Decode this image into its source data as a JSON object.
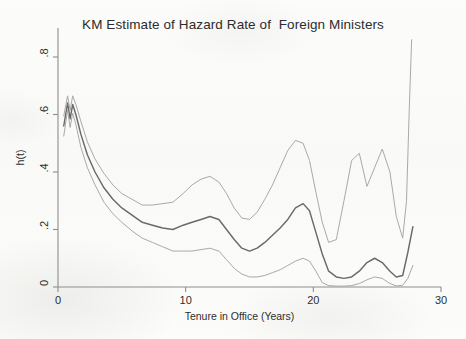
{
  "chart_data": {
    "type": "line",
    "title": "KM Estimate of Hazard Rate of  Foreign Ministers",
    "xlabel": "Tenure in Office (Years)",
    "ylabel": "h(t)",
    "xlim": [
      0,
      30
    ],
    "ylim": [
      0,
      0.9
    ],
    "xticks": [
      0,
      10,
      20,
      30
    ],
    "xticklabels": [
      "0",
      "10",
      "20",
      "30"
    ],
    "yticks": [
      0,
      0.2,
      0.4,
      0.6,
      0.8
    ],
    "yticklabels": [
      "0",
      ".2",
      ".4",
      ".6",
      ".8"
    ],
    "grid": false,
    "legend": "none",
    "colors": {
      "estimate": "#6a6a6a",
      "confidence_band": "#a9a9a9",
      "axis": "#8d8d8d",
      "text": "#2c2c2c",
      "background": "#fbfbfa"
    },
    "series": [
      {
        "name": "Smoothed hazard estimate",
        "role": "estimate",
        "color": "#6a6a6a",
        "x": [
          0.45,
          0.75,
          0.95,
          1.15,
          1.4,
          1.8,
          2.3,
          2.9,
          3.6,
          4.3,
          5.0,
          5.8,
          6.6,
          7.4,
          8.2,
          9.0,
          9.8,
          10.5,
          11.2,
          11.9,
          12.6,
          13.2,
          13.8,
          14.4,
          15.0,
          15.6,
          16.2,
          16.8,
          17.4,
          18.0,
          18.6,
          19.2,
          19.7,
          20.2,
          20.7,
          21.2,
          21.8,
          22.4,
          23.0,
          23.6,
          24.2,
          24.8,
          25.4,
          26.0,
          26.5,
          27.0,
          27.4,
          27.8
        ],
        "y": [
          0.56,
          0.64,
          0.585,
          0.635,
          0.6,
          0.53,
          0.46,
          0.4,
          0.345,
          0.305,
          0.275,
          0.25,
          0.225,
          0.215,
          0.205,
          0.2,
          0.215,
          0.225,
          0.235,
          0.245,
          0.235,
          0.2,
          0.165,
          0.135,
          0.125,
          0.135,
          0.155,
          0.18,
          0.205,
          0.235,
          0.275,
          0.29,
          0.265,
          0.19,
          0.115,
          0.055,
          0.035,
          0.03,
          0.035,
          0.055,
          0.085,
          0.1,
          0.085,
          0.055,
          0.035,
          0.04,
          0.12,
          0.21
        ]
      },
      {
        "name": "Upper 95% confidence limit",
        "role": "upper",
        "color": "#a9a9a9",
        "x": [
          0.45,
          0.75,
          0.95,
          1.15,
          1.4,
          1.8,
          2.3,
          2.9,
          3.6,
          4.3,
          5.0,
          5.8,
          6.6,
          7.4,
          8.2,
          9.0,
          9.8,
          10.5,
          11.2,
          11.9,
          12.6,
          13.2,
          13.8,
          14.4,
          15.0,
          15.6,
          16.2,
          16.8,
          17.4,
          18.0,
          18.6,
          19.2,
          19.7,
          20.2,
          20.7,
          21.2,
          21.8,
          22.4,
          23.0,
          23.6,
          24.2,
          24.8,
          25.4,
          26.0,
          26.5,
          27.0,
          27.3,
          27.5,
          27.7
        ],
        "y": [
          0.595,
          0.665,
          0.615,
          0.665,
          0.635,
          0.575,
          0.505,
          0.445,
          0.395,
          0.355,
          0.325,
          0.305,
          0.285,
          0.285,
          0.29,
          0.295,
          0.325,
          0.355,
          0.375,
          0.385,
          0.365,
          0.325,
          0.275,
          0.24,
          0.235,
          0.26,
          0.305,
          0.355,
          0.415,
          0.475,
          0.51,
          0.5,
          0.44,
          0.33,
          0.225,
          0.155,
          0.165,
          0.3,
          0.44,
          0.465,
          0.35,
          0.415,
          0.48,
          0.4,
          0.245,
          0.17,
          0.3,
          0.6,
          0.86
        ]
      },
      {
        "name": "Lower 95% confidence limit",
        "role": "lower",
        "color": "#a9a9a9",
        "x": [
          0.45,
          0.75,
          0.95,
          1.15,
          1.4,
          1.8,
          2.3,
          2.9,
          3.6,
          4.3,
          5.0,
          5.8,
          6.6,
          7.4,
          8.2,
          9.0,
          9.8,
          10.5,
          11.2,
          11.9,
          12.6,
          13.2,
          13.8,
          14.4,
          15.0,
          15.6,
          16.2,
          16.8,
          17.4,
          18.0,
          18.6,
          19.2,
          19.7,
          20.2,
          20.7,
          21.2,
          21.8,
          22.4,
          23.0,
          23.6,
          24.2,
          24.8,
          25.4,
          26.0,
          26.5,
          27.0,
          27.4,
          27.8
        ],
        "y": [
          0.525,
          0.615,
          0.555,
          0.605,
          0.565,
          0.485,
          0.415,
          0.355,
          0.295,
          0.255,
          0.225,
          0.195,
          0.17,
          0.155,
          0.14,
          0.125,
          0.125,
          0.125,
          0.13,
          0.135,
          0.125,
          0.095,
          0.065,
          0.045,
          0.035,
          0.035,
          0.04,
          0.05,
          0.06,
          0.075,
          0.09,
          0.1,
          0.09,
          0.055,
          0.015,
          0.005,
          0.003,
          0.003,
          0.005,
          0.012,
          0.025,
          0.035,
          0.03,
          0.012,
          0.004,
          0.006,
          0.03,
          0.075
        ]
      }
    ],
    "annotations": []
  },
  "axes_geometry": {
    "plot_left_px": 58,
    "plot_right_px": 441,
    "plot_bottom_px": 287,
    "plot_top_px": 28
  }
}
